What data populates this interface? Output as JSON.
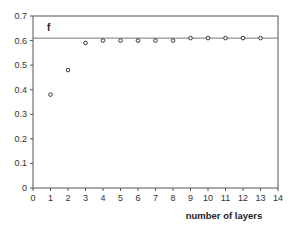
{
  "chart_data": {
    "type": "scatter",
    "title": "",
    "xlabel": "number of layers",
    "ylabel": "",
    "annotation": "f",
    "xlim": [
      0,
      14
    ],
    "ylim": [
      0,
      0.7
    ],
    "xticks": [
      0,
      1,
      2,
      3,
      4,
      5,
      6,
      7,
      8,
      9,
      10,
      11,
      12,
      13,
      14
    ],
    "yticks": [
      0,
      0.1,
      0.2,
      0.3,
      0.4,
      0.5,
      0.6,
      0.7
    ],
    "ytick_labels": [
      "0",
      "0.1",
      "0.2",
      "0.3",
      "0.4",
      "0.5",
      "0.6",
      "0.7"
    ],
    "grid": false,
    "legend": null,
    "series": [
      {
        "name": "f",
        "marker": "open-circle",
        "x": [
          1,
          2,
          3,
          4,
          5,
          6,
          7,
          8,
          9,
          10,
          11,
          12,
          13
        ],
        "y": [
          0.38,
          0.48,
          0.59,
          0.6,
          0.6,
          0.6,
          0.6,
          0.6,
          0.61,
          0.61,
          0.61,
          0.61,
          0.61
        ]
      }
    ],
    "reference_lines": [
      {
        "orientation": "horizontal",
        "y": 0.61,
        "label": ""
      }
    ]
  },
  "colors": {
    "axis": "#555555",
    "marker": "#333333",
    "reference_line": "#666666"
  }
}
